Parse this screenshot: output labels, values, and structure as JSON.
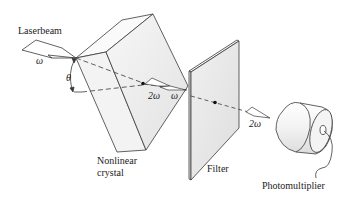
{
  "diagram": {
    "labels": {
      "laserbeam": "Laserbeam",
      "omega_in": "ω",
      "theta": "θ",
      "two_omega_inner": "2ω",
      "omega_inner": "ω",
      "nonlinear_crystal_line1": "Nonlinear",
      "nonlinear_crystal_line2": "crystal",
      "filter": "Filter",
      "two_omega_out": "2ω",
      "photomultiplier": "Photomultiplier"
    },
    "components": [
      "Laser beam input",
      "Nonlinear crystal",
      "Filter",
      "Photomultiplier"
    ],
    "colors": {
      "line": "#3a3a3a",
      "face_fill": "#ececec",
      "face_fill_light": "#f5f5f5",
      "background": "#ffffff"
    }
  }
}
